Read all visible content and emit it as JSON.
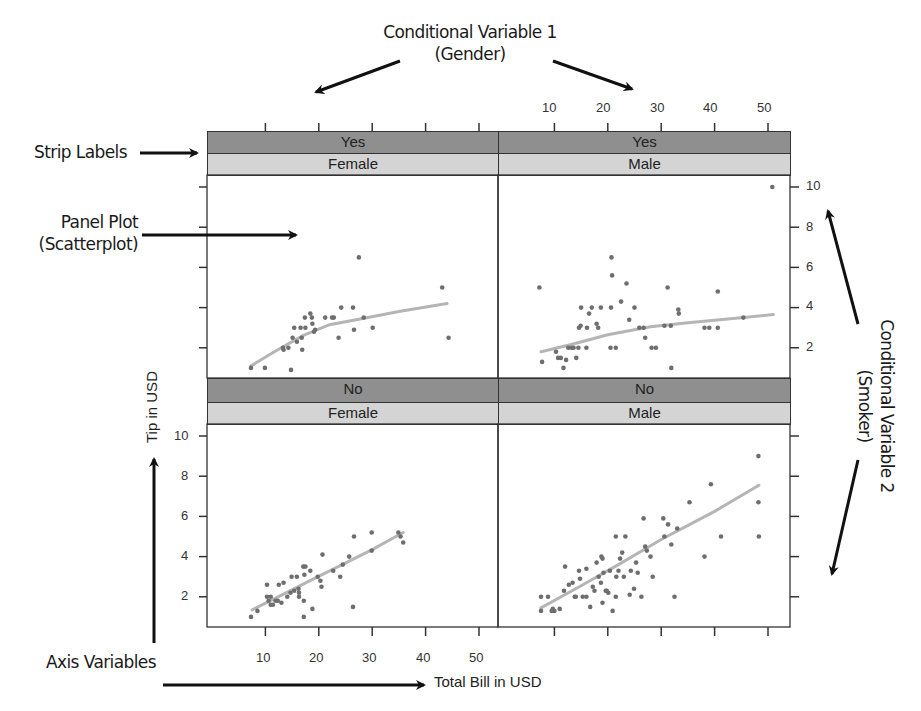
{
  "annotations": {
    "cond_var_1_line1": "Conditional Variable 1",
    "cond_var_1_line2": "(Gender)",
    "cond_var_2_line1": "Conditional Variable 2",
    "cond_var_2_line2": "(Smoker)",
    "strip_labels": "Strip Labels",
    "panel_plot_line1": "Panel Plot",
    "panel_plot_line2": "(Scatterplot)",
    "axis_variables": "Axis Variables"
  },
  "axes": {
    "xlabel": "Total Bill in USD",
    "ylabel": "Tip in USD",
    "x_ticks": [
      "10",
      "20",
      "30",
      "40",
      "50"
    ],
    "y_ticks": [
      "10",
      "8",
      "6",
      "4",
      "2"
    ]
  },
  "strips": {
    "top_left": {
      "smoker": "Yes",
      "sex": "Female"
    },
    "top_right": {
      "smoker": "Yes",
      "sex": "Male"
    },
    "bottom_left": {
      "smoker": "No",
      "sex": "Female"
    },
    "bottom_right": {
      "smoker": "No",
      "sex": "Male"
    }
  },
  "colors": {
    "strip_dark": "#8f8f8f",
    "strip_light": "#d4d4d4",
    "point": "#6e6e6e",
    "smooth_line": "#b5b5b5",
    "frame": "#333333"
  },
  "chart_data": {
    "type": "scatter",
    "title": "",
    "xlabel": "Total Bill in USD",
    "ylabel": "Tip in USD",
    "xlim": [
      3,
      54
    ],
    "ylim": [
      0.5,
      10.5
    ],
    "x_ticks": [
      10,
      20,
      30,
      40,
      50
    ],
    "y_ticks": [
      2,
      4,
      6,
      8,
      10
    ],
    "grid": false,
    "layout": "2x2 trellis (lattice) panels conditioned on smoker (rows) and sex (columns)",
    "panels": [
      {
        "name": "Yes / Female",
        "smoker": "Yes",
        "sex": "Female",
        "points": [
          [
            7.3,
            1.0
          ],
          [
            9.9,
            1.0
          ],
          [
            16.6,
            3.0
          ],
          [
            14.3,
            2.0
          ],
          [
            13.3,
            2.0
          ],
          [
            15.1,
            2.5
          ],
          [
            13.4,
            1.9
          ],
          [
            17.4,
            3.5
          ],
          [
            15.9,
            2.3
          ],
          [
            15.4,
            3.0
          ],
          [
            16.8,
            2.5
          ],
          [
            17.5,
            3.0
          ],
          [
            18.7,
            3.5
          ],
          [
            18.4,
            3.7
          ],
          [
            19.1,
            2.8
          ],
          [
            18.8,
            3.2
          ],
          [
            19.3,
            2.9
          ],
          [
            22.8,
            3.5
          ],
          [
            21.2,
            3.5
          ],
          [
            24.2,
            4.0
          ],
          [
            22.5,
            3.5
          ],
          [
            23.7,
            2.5
          ],
          [
            26.4,
            4.0
          ],
          [
            26.6,
            2.9
          ],
          [
            28.4,
            3.5
          ],
          [
            30.1,
            3.0
          ],
          [
            27.5,
            6.5
          ],
          [
            43.1,
            5.0
          ],
          [
            44.3,
            2.5
          ],
          [
            14.8,
            0.9
          ],
          [
            16.9,
            1.9
          ]
        ],
        "smooth": [
          [
            7.3,
            1.1
          ],
          [
            12,
            1.85
          ],
          [
            17,
            2.6
          ],
          [
            22,
            3.15
          ],
          [
            28,
            3.45
          ],
          [
            35,
            3.8
          ],
          [
            44,
            4.2
          ]
        ]
      },
      {
        "name": "Yes / Male",
        "smoker": "Yes",
        "sex": "Male",
        "points": [
          [
            7.2,
            5.0
          ],
          [
            7.7,
            1.3
          ],
          [
            10.3,
            1.8
          ],
          [
            10.7,
            1.5
          ],
          [
            11.2,
            1.5
          ],
          [
            12.2,
            1.4
          ],
          [
            11.7,
            1.0
          ],
          [
            12.6,
            2.0
          ],
          [
            13.2,
            2.0
          ],
          [
            13.6,
            2.0
          ],
          [
            14.1,
            1.5
          ],
          [
            14.5,
            2.0
          ],
          [
            16.0,
            2.0
          ],
          [
            14.6,
            3.0
          ],
          [
            14.9,
            3.1
          ],
          [
            15.0,
            4.0
          ],
          [
            16.1,
            3.0
          ],
          [
            16.5,
            3.7
          ],
          [
            17.0,
            4.0
          ],
          [
            18.2,
            3.0
          ],
          [
            17.9,
            3.2
          ],
          [
            18.7,
            4.0
          ],
          [
            20.6,
            4.0
          ],
          [
            20.5,
            2.0
          ],
          [
            21.5,
            2.0
          ],
          [
            20.7,
            6.5
          ],
          [
            20.8,
            5.6
          ],
          [
            22.5,
            4.3
          ],
          [
            23.5,
            5.2
          ],
          [
            24.0,
            3.4
          ],
          [
            25.0,
            4.0
          ],
          [
            25.9,
            3.0
          ],
          [
            26.7,
            3.0
          ],
          [
            27.0,
            2.5
          ],
          [
            28.2,
            2.0
          ],
          [
            29.0,
            2.0
          ],
          [
            30.6,
            3.1
          ],
          [
            31.8,
            3.1
          ],
          [
            31.2,
            5.0
          ],
          [
            31.9,
            1.0
          ],
          [
            33.3,
            3.7
          ],
          [
            33.2,
            3.9
          ],
          [
            38.1,
            3.0
          ],
          [
            39.0,
            3.0
          ],
          [
            40.6,
            3.0
          ],
          [
            40.6,
            4.8
          ],
          [
            45.4,
            3.5
          ],
          [
            50.8,
            10.0
          ]
        ],
        "smooth": [
          [
            7.5,
            1.8
          ],
          [
            13,
            2.15
          ],
          [
            20,
            2.65
          ],
          [
            28,
            3.05
          ],
          [
            35,
            3.25
          ],
          [
            43,
            3.45
          ],
          [
            51,
            3.65
          ]
        ]
      },
      {
        "name": "No / Female",
        "smoker": "No",
        "sex": "Female",
        "points": [
          [
            7.3,
            1.0
          ],
          [
            8.5,
            1.3
          ],
          [
            10.3,
            2.6
          ],
          [
            10.3,
            2.0
          ],
          [
            10.6,
            1.8
          ],
          [
            11.0,
            2.0
          ],
          [
            11.0,
            1.6
          ],
          [
            11.4,
            1.6
          ],
          [
            11.9,
            1.8
          ],
          [
            12.3,
            1.8
          ],
          [
            12.5,
            2.6
          ],
          [
            13.0,
            1.7
          ],
          [
            13.4,
            2.7
          ],
          [
            14.1,
            2.0
          ],
          [
            14.7,
            2.2
          ],
          [
            14.9,
            3.0
          ],
          [
            15.4,
            2.3
          ],
          [
            15.9,
            3.0
          ],
          [
            16.2,
            2.4
          ],
          [
            16.3,
            2.0
          ],
          [
            16.3,
            2.2
          ],
          [
            17.1,
            3.5
          ],
          [
            17.3,
            3.1
          ],
          [
            17.5,
            3.5
          ],
          [
            17.2,
            1.0
          ],
          [
            18.4,
            3.3
          ],
          [
            18.8,
            1.4
          ],
          [
            19.8,
            3.0
          ],
          [
            20.3,
            2.8
          ],
          [
            20.5,
            2.5
          ],
          [
            20.7,
            4.1
          ],
          [
            22.7,
            3.3
          ],
          [
            24.0,
            3.0
          ],
          [
            24.5,
            3.6
          ],
          [
            25.7,
            4.0
          ],
          [
            26.6,
            5.0
          ],
          [
            26.4,
            1.5
          ],
          [
            29.9,
            4.3
          ],
          [
            29.9,
            5.2
          ],
          [
            34.9,
            5.2
          ],
          [
            35.3,
            5.0
          ],
          [
            35.8,
            4.7
          ],
          [
            17.2,
            1.8
          ]
        ],
        "smooth": [
          [
            7.5,
            1.35
          ],
          [
            12,
            1.95
          ],
          [
            18,
            2.75
          ],
          [
            24,
            3.55
          ],
          [
            30,
            4.35
          ],
          [
            35.8,
            5.2
          ]
        ]
      },
      {
        "name": "No / Male",
        "smoker": "No",
        "sex": "Male",
        "points": [
          [
            7.5,
            2.0
          ],
          [
            8.8,
            2.0
          ],
          [
            7.5,
            1.3
          ],
          [
            9.5,
            1.3
          ],
          [
            10.0,
            1.3
          ],
          [
            9.7,
            1.4
          ],
          [
            11.0,
            1.4
          ],
          [
            11.8,
            2.3
          ],
          [
            12.0,
            3.5
          ],
          [
            12.7,
            2.6
          ],
          [
            13.4,
            2.7
          ],
          [
            13.8,
            2.0
          ],
          [
            14.0,
            2.0
          ],
          [
            14.6,
            3.3
          ],
          [
            14.8,
            2.9
          ],
          [
            15.3,
            2.0
          ],
          [
            16.0,
            2.0
          ],
          [
            16.0,
            3.4
          ],
          [
            16.7,
            1.5
          ],
          [
            17.2,
            2.5
          ],
          [
            17.5,
            2.3
          ],
          [
            17.9,
            3.7
          ],
          [
            18.3,
            3.0
          ],
          [
            18.7,
            2.7
          ],
          [
            19.0,
            1.7
          ],
          [
            19.2,
            3.2
          ],
          [
            18.8,
            4.0
          ],
          [
            19.0,
            3.9
          ],
          [
            19.6,
            2.3
          ],
          [
            19.8,
            2.3
          ],
          [
            20.1,
            2.2
          ],
          [
            20.4,
            3.3
          ],
          [
            20.9,
            1.3
          ],
          [
            21.6,
            3.0
          ],
          [
            21.5,
            2.0
          ],
          [
            22.0,
            3.3
          ],
          [
            21.5,
            5.0
          ],
          [
            22.3,
            3.9
          ],
          [
            22.7,
            4.2
          ],
          [
            23.0,
            3.0
          ],
          [
            23.3,
            5.0
          ],
          [
            24.1,
            2.1
          ],
          [
            24.3,
            3.3
          ],
          [
            24.9,
            2.4
          ],
          [
            25.3,
            3.7
          ],
          [
            25.6,
            3.2
          ],
          [
            26.3,
            2.0
          ],
          [
            26.7,
            5.9
          ],
          [
            27.0,
            4.5
          ],
          [
            27.3,
            4.3
          ],
          [
            28.0,
            4.0
          ],
          [
            28.4,
            3.0
          ],
          [
            30.4,
            5.9
          ],
          [
            30.6,
            5.0
          ],
          [
            31.3,
            5.6
          ],
          [
            31.9,
            4.6
          ],
          [
            33.0,
            5.4
          ],
          [
            32.5,
            2.0
          ],
          [
            35.3,
            6.7
          ],
          [
            38.1,
            4.0
          ],
          [
            39.3,
            7.6
          ],
          [
            41.2,
            5.0
          ],
          [
            48.2,
            9.0
          ],
          [
            48.2,
            6.7
          ],
          [
            48.3,
            5.0
          ]
        ],
        "smooth": [
          [
            7.5,
            1.45
          ],
          [
            15,
            2.55
          ],
          [
            22,
            3.6
          ],
          [
            30,
            4.85
          ],
          [
            40,
            6.25
          ],
          [
            48.3,
            7.55
          ]
        ]
      }
    ]
  }
}
